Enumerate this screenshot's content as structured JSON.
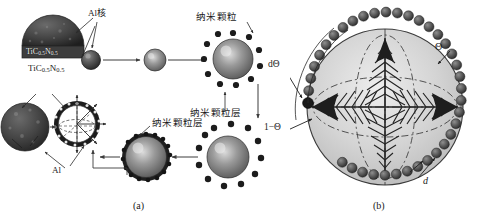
{
  "figure": {
    "captions": {
      "panel_a": "(a)",
      "panel_b": "(b)"
    }
  },
  "panel_a": {
    "labels": {
      "al_core": "Al核",
      "ticn_top": "TiC",
      "ticn_top_sub1": "0.5",
      "ticn_top_n": "N",
      "ticn_top_sub2": "0.5",
      "ticn_formula_plain": "TiC0.5N0.5",
      "ticn_lower": "TiC",
      "ticn_lower_sub1": "0.5",
      "ticn_lower_n": "N",
      "ticn_lower_sub2": "0.5",
      "al_shell": "Al",
      "nanoparticle": "纳米颗粒",
      "nanoparticle_layer_top": "纳米颗粒层",
      "nanoparticle_layer_bottom": "纳米颗粒层"
    },
    "colors": {
      "particle_dark": "#3a3a3a",
      "particle_mid": "#6f6f6f",
      "particle_light": "#c8c8c8",
      "arrow": "#4a4a4a",
      "outline": "#2b2b2b"
    }
  },
  "panel_b": {
    "labels": {
      "theta": "Θ",
      "d_theta": "dΘ",
      "one_minus_theta": "1−Θ",
      "d": "d"
    },
    "colors": {
      "sphere_fill": "#d2d2d2",
      "bead": "#5a5a5a",
      "dendrite": "#2f2f2f",
      "outline": "#3a3a3a"
    }
  }
}
